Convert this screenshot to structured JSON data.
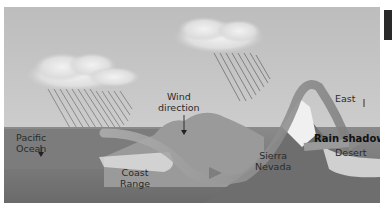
{
  "diagram": {
    "labels": {
      "pacific_ocean_line1": "Pacific",
      "pacific_ocean_line2": "Ocean",
      "wind_direction_line1": "Wind",
      "wind_direction_line2": "direction",
      "coast_range_line1": "Coast",
      "coast_range_line2": "Range",
      "sierra_nevada_line1": "Sierra",
      "sierra_nevada_line2": "Nevada",
      "east": "East",
      "rain_shadow": "Rain shadow",
      "desert": "Desert"
    },
    "colors": {
      "sky": "#c9c9c9",
      "ocean": "#7a7a7a",
      "mountain_dark": "#6e6e6e",
      "mountain_light": "#a8a8a8",
      "wind_arrow": "#8c8c8c",
      "text": "#2b2b2b"
    }
  }
}
